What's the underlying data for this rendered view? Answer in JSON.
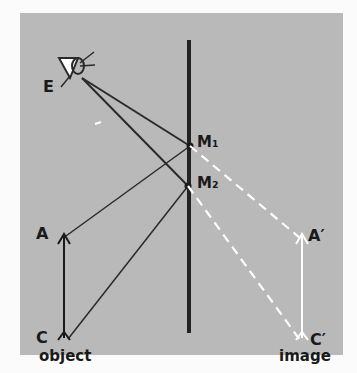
{
  "diagram": {
    "labels": {
      "eye": "E",
      "m1": "M₁",
      "m2": "M₂",
      "a": "A",
      "c": "C",
      "a_prime": "A′",
      "c_prime": "C′",
      "object": "object",
      "image": "image"
    },
    "colors": {
      "background": "#b9b9b9",
      "lines": "#2a2a2a",
      "virtual_rays": "#ffffff"
    }
  }
}
